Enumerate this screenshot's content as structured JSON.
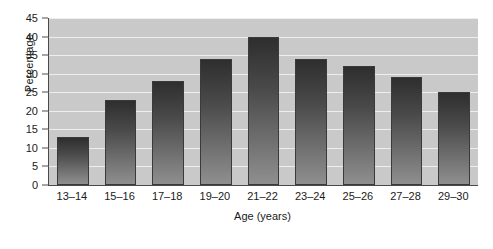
{
  "chart_data": {
    "type": "bar",
    "title": "",
    "xlabel": "Age (years)",
    "ylabel": "Percentage",
    "categories": [
      "13–14",
      "15–16",
      "17–18",
      "19–20",
      "21–22",
      "23–24",
      "25–26",
      "27–28",
      "29–30"
    ],
    "values": [
      13,
      23,
      28,
      34,
      40,
      34,
      32,
      29,
      25
    ],
    "ylim": [
      0,
      45
    ],
    "yticks": [
      0,
      5,
      10,
      15,
      20,
      25,
      30,
      35,
      40,
      45
    ],
    "ytick_labels": [
      "0",
      "5",
      "10",
      "15",
      "20",
      "25",
      "30",
      "35",
      "40",
      "45"
    ],
    "grid": true,
    "legend": "none",
    "colors": {
      "plot_background": "#c9c9c9",
      "gridline": "#eeeeee",
      "bar_top": "#2e2e2e",
      "bar_bottom": "#8f8f8f",
      "axis": "#4a4a4a",
      "text": "#1a1a1a"
    }
  }
}
